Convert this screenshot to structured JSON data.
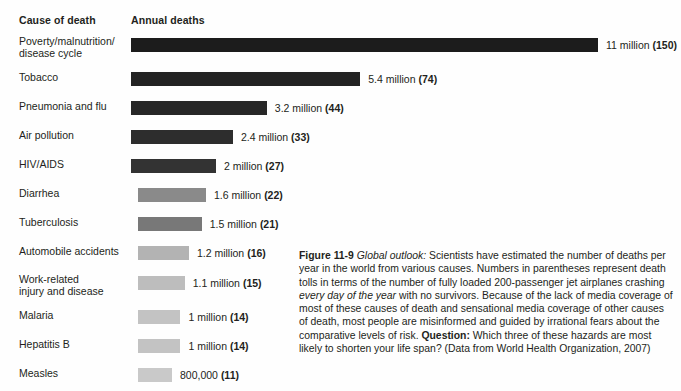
{
  "headers": {
    "cause": "Cause of death",
    "deaths": "Annual deaths"
  },
  "chart_data": {
    "type": "bar",
    "title": "Annual deaths",
    "xlabel": "Annual deaths",
    "ylabel": "Cause of death",
    "orientation": "horizontal",
    "grid": false,
    "legend": null,
    "xlim": [
      0,
      11
    ],
    "units": "millions of deaths per year",
    "categories": [
      "Poverty/malnutrition/\ndisease cycle",
      "Tobacco",
      "Pneumonia and flu",
      "Air pollution",
      "HIV/AIDS",
      "Diarrhea",
      "Tuberculosis",
      "Automobile accidents",
      "Work-related\ninjury and disease",
      "Malaria",
      "Hepatitis B",
      "Measles"
    ],
    "values": [
      11,
      5.4,
      3.2,
      2.4,
      2,
      1.6,
      1.5,
      1.2,
      1.1,
      1,
      1,
      0.8
    ],
    "value_labels": [
      "11 million (150)",
      "5.4  million (74)",
      "3.2 million (44)",
      "2.4 million (33)",
      "2 million (27)",
      "1.6 million (22)",
      "1.5 million (21)",
      "1.2 million (16)",
      "1.1 million (15)",
      "1 million (14)",
      "1 million (14)",
      "800,000 (11)"
    ],
    "jet_equivalents": [
      150,
      74,
      44,
      33,
      27,
      22,
      21,
      16,
      15,
      14,
      14,
      11
    ],
    "bar_colors": [
      "#1c1c1c",
      "#232323",
      "#272727",
      "#2d2d2d",
      "#333333",
      "#8a8a8a",
      "#787878",
      "#b3b3b3",
      "#bdbdbd",
      "#c3c3c3",
      "#c3c3c3",
      "#c9c9c9"
    ]
  },
  "caption": {
    "figure_number": "Figure 11-9",
    "lead_italic": "Global outlook:",
    "text_1": " Scientists have estimated the number of deaths per year in the world from various causes. Numbers in parentheses represent death tolls in terms of the number of fully loaded 200-passenger jet airplanes crashing ",
    "italic_1": "every day of the year",
    "text_2": " with no survivors. Because of the lack of media coverage of most of these causes of death and sensational media coverage of other causes of death, most people are misinformed and guided by irrational fears about the comparative levels of risk. ",
    "question_label": "Question:",
    "text_3": " Which three of these hazards are most likely to shorten your life span? (Data from World Health Organization, 2007)"
  }
}
